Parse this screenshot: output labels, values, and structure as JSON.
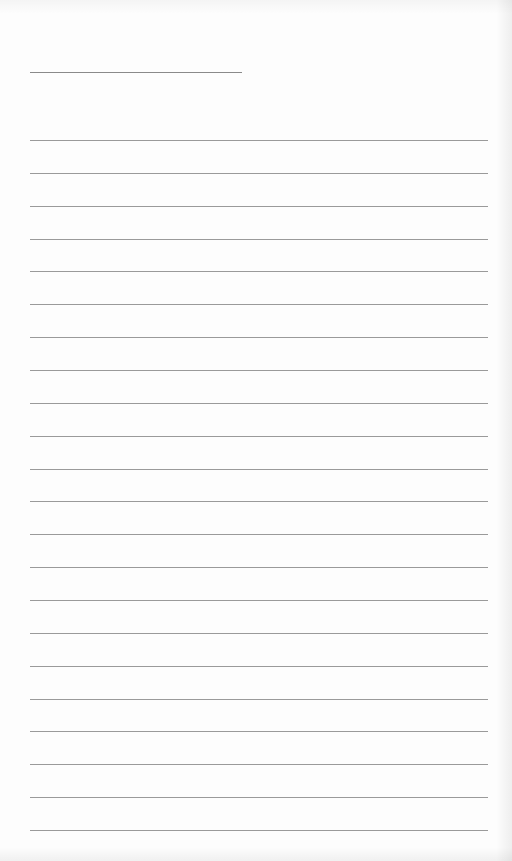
{
  "page": {
    "type": "blank lined notepaper",
    "title_line": {
      "text": ""
    },
    "ruled_lines": [
      {
        "text": ""
      },
      {
        "text": ""
      },
      {
        "text": ""
      },
      {
        "text": ""
      },
      {
        "text": ""
      },
      {
        "text": ""
      },
      {
        "text": ""
      },
      {
        "text": ""
      },
      {
        "text": ""
      },
      {
        "text": ""
      },
      {
        "text": ""
      },
      {
        "text": ""
      },
      {
        "text": ""
      },
      {
        "text": ""
      },
      {
        "text": ""
      },
      {
        "text": ""
      },
      {
        "text": ""
      },
      {
        "text": ""
      },
      {
        "text": ""
      },
      {
        "text": ""
      },
      {
        "text": ""
      },
      {
        "text": ""
      }
    ],
    "colors": {
      "paper": "#fdfdfd",
      "line": "#9a9a9a",
      "title_line": "#8a8a8a"
    }
  }
}
